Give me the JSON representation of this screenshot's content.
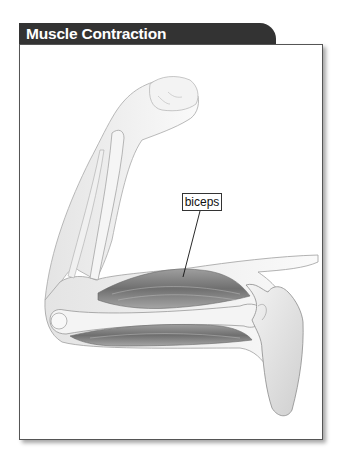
{
  "figure": {
    "title": "Muscle Contraction",
    "labels": [
      {
        "text": "biceps",
        "target": "biceps-muscle"
      }
    ]
  },
  "colors": {
    "title_bg": "#333333",
    "title_text": "#ffffff",
    "frame_border": "#555555",
    "muscle": "#8a8a8a",
    "bone": "#f2f2f2",
    "skin_outline": "#9a9a9a"
  }
}
